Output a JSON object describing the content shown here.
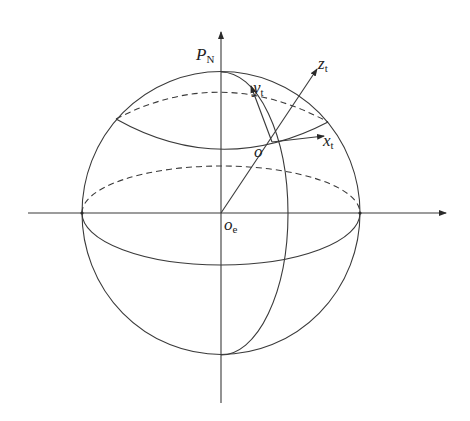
{
  "diagram": {
    "type": "earth-coordinate-frame",
    "colors": {
      "stroke": "#3a3a3a",
      "background": "#ffffff",
      "text": "#222222"
    },
    "labels": {
      "pole": {
        "main": "P",
        "sub": "N"
      },
      "earth_center": {
        "main": "o",
        "sub": "e"
      },
      "origin": {
        "main": "o"
      },
      "x_axis": {
        "main": "x",
        "sub": "t"
      },
      "y_axis": {
        "main": "y",
        "sub": "t"
      },
      "z_axis": {
        "main": "z",
        "sub": "t"
      }
    },
    "elements": [
      "sphere-outline",
      "vertical-polar-axis",
      "horizontal-equatorial-axis",
      "equator (front solid, back dashed)",
      "latitude circle (front solid, back dashed)",
      "meridian through origin o",
      "local frame axes x_t, y_t, z_t at o",
      "radius line o_e to o extended as z_t"
    ]
  }
}
